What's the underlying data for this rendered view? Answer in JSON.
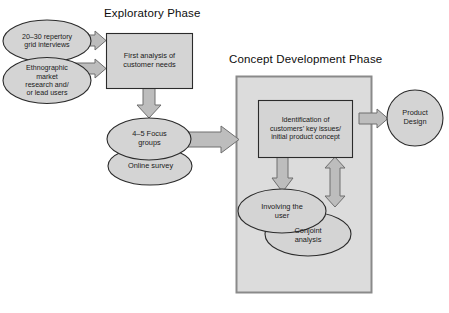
{
  "diagram": {
    "title_exploratory": "Exploratory Phase",
    "title_concept": "Concept Development Phase",
    "nodes": {
      "repertory_grid": "20–30 repertory\ngrid interviews",
      "ethnographic": "Ethnographic\nmarket\nresearch and/\nor lead users",
      "first_analysis": "First analysis of\ncustomer needs",
      "focus_groups": "4–5 Focus\ngroups",
      "online_survey": "Online survey",
      "identification": "Identification of\ncustomers’ key issues/\ninitial product concept",
      "involving_user": "Involving the\nuser",
      "conjoint": "Conjoint\nanalysis",
      "product_design": "Product\nDesign"
    },
    "icons": {
      "arrow_repertory_to_analysis": "arrow-right-icon",
      "arrow_ethnographic_to_analysis": "arrow-right-icon",
      "arrow_analysis_to_focus": "arrow-down-icon",
      "arrow_focus_to_concept": "arrow-right-icon",
      "arrow_identification_to_involving": "arrow-down-icon",
      "arrow_identification_involving_double": "arrow-up-down-icon",
      "arrow_concept_to_product": "arrow-right-icon"
    },
    "colors": {
      "shape_fill": "#d4d4d4",
      "shape_stroke": "#2b2b2b",
      "container_fill": "#dcdcdc",
      "container_stroke": "#8a8a8a",
      "arrow_fill": "#bdbdbd",
      "arrow_stroke": "#6e6e6e",
      "text": "#1a1a1a",
      "background": "#ffffff"
    }
  }
}
